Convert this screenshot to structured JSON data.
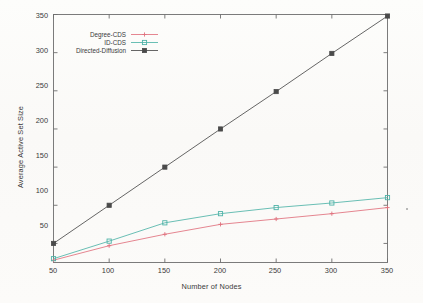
{
  "chart_data": {
    "type": "line",
    "title": "",
    "xlabel": "Number of Nodes",
    "ylabel": "Average Active Set Size",
    "x": [
      50,
      100,
      150,
      200,
      250,
      300,
      350
    ],
    "xlim": [
      50,
      350
    ],
    "ylim": [
      25,
      350
    ],
    "xticks": [
      "50",
      "100",
      "150",
      "200",
      "250",
      "300",
      "350"
    ],
    "yticks": [
      "50",
      "100",
      "150",
      "200",
      "250",
      "300",
      "350"
    ],
    "grid": false,
    "legend_position": "top-left",
    "series": [
      {
        "name": "Degree-CDS",
        "color": "#e0707d",
        "marker": "plus",
        "values": [
          28,
          47,
          62,
          75,
          82,
          89,
          97
        ]
      },
      {
        "name": "ID-CDS",
        "color": "#4fb3a8",
        "marker": "square",
        "values": [
          30,
          53,
          77,
          89,
          97,
          103,
          110
        ]
      },
      {
        "name": "Directed-Diffusion",
        "color": "#4a4a4a",
        "marker": "filled-square",
        "values": [
          50,
          100,
          150,
          200,
          249,
          299,
          348
        ]
      }
    ]
  },
  "axes": {
    "xlabel": "Number of Nodes",
    "ylabel": "Average Active Set Size",
    "xticks": [
      "50",
      "100",
      "150",
      "200",
      "250",
      "300",
      "350"
    ],
    "yticks": [
      "50",
      "100",
      "150",
      "200",
      "250",
      "300",
      "350"
    ]
  },
  "legend": {
    "items": [
      {
        "label": "Degree-CDS"
      },
      {
        "label": "ID-CDS"
      },
      {
        "label": "Directed-Diffusion"
      }
    ]
  },
  "style": {
    "frame_color": "#6e6e6e",
    "text_color": "#3a3a3a",
    "background": "#fbfbf9"
  }
}
